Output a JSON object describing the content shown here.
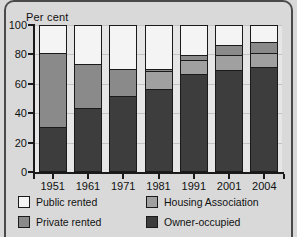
{
  "chart_data": {
    "type": "bar",
    "subtype": "stacked-bar-100",
    "title": "",
    "ylabel": "Per cent",
    "xlabel": "",
    "ylim": [
      0,
      100
    ],
    "yticks": [
      0,
      20,
      40,
      60,
      80,
      100
    ],
    "ytick_labels": [
      "0",
      "20",
      "40",
      "60",
      "80",
      "100"
    ],
    "grid": true,
    "legend_position": "bottom",
    "categories": [
      "1951",
      "1961",
      "1971",
      "1981",
      "1991",
      "2001",
      "2004"
    ],
    "series": [
      {
        "name": "Owner-occupied",
        "color": "#3d3d3d",
        "values": [
          30,
          43,
          51,
          56,
          66,
          69,
          71
        ]
      },
      {
        "name": "Private rented",
        "color": "#8a8a8a",
        "values": [
          51,
          30,
          19,
          2,
          3,
          7,
          7
        ]
      },
      {
        "name": "Housing Association",
        "color": "#a0a0a0",
        "values": [
          0,
          0,
          0,
          12,
          10,
          10,
          10
        ]
      },
      {
        "name": "Public rented",
        "color": "#f4f4f4",
        "values": [
          19,
          27,
          30,
          30,
          21,
          14,
          12
        ]
      }
    ],
    "stack_order_bottom_to_top": [
      "Owner-occupied",
      "Housing Association",
      "Private rented",
      "Public rented"
    ],
    "cumulative_tops": {
      "1951": {
        "Owner-occupied": 30,
        "Housing Association": 30,
        "Private rented": 81,
        "Public rented": 100
      },
      "1961": {
        "Owner-occupied": 43,
        "Housing Association": 43,
        "Private rented": 73,
        "Public rented": 100
      },
      "1971": {
        "Owner-occupied": 51,
        "Housing Association": 51,
        "Private rented": 70,
        "Public rented": 100
      },
      "1981": {
        "Owner-occupied": 56,
        "Housing Association": 68,
        "Private rented": 70,
        "Public rented": 100
      },
      "1991": {
        "Owner-occupied": 66,
        "Housing Association": 76,
        "Private rented": 79,
        "Public rented": 100
      },
      "2001": {
        "Owner-occupied": 69,
        "Housing Association": 76,
        "Private rented": 86,
        "Public rented": 100
      },
      "2004": {
        "Owner-occupied": 71,
        "Housing Association": 78,
        "Private rented": 88,
        "Public rented": 100
      }
    }
  },
  "axis": {
    "y_title": "Per cent"
  },
  "legend": {
    "items": [
      {
        "label": "Public rented",
        "color": "#f4f4f4"
      },
      {
        "label": "Housing Association",
        "color": "#a0a0a0"
      },
      {
        "label": "Private rented",
        "color": "#8a8a8a"
      },
      {
        "label": "Owner-occupied",
        "color": "#3d3d3d"
      }
    ]
  },
  "colors": {
    "plot_background": "#e6e6e6",
    "page_background": "#d9d9d9",
    "axis": "#1a1a1a",
    "gridline": "#c4c4c4"
  }
}
